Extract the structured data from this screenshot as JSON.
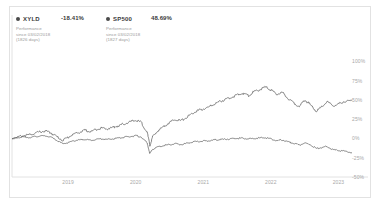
{
  "legend": {
    "entries": [
      {
        "ticker": "XYLD",
        "value": "-18.41%",
        "metric": "Performance",
        "since": "since 03/02/2018",
        "days": "(1826 days)",
        "dot_color": "#4a4a4a"
      },
      {
        "ticker": "SP500",
        "value": "48.69%",
        "metric": "Performance",
        "since": "since 03/02/2018",
        "days": "(1827 days)",
        "dot_color": "#4a4a4a"
      }
    ]
  },
  "chart_data": {
    "type": "line",
    "title": "",
    "xlabel": "",
    "ylabel": "",
    "grid": false,
    "legend_position": "top-left",
    "yticks": [
      "100%",
      "75%",
      "50%",
      "25%",
      "0%",
      "-25%",
      "-50%"
    ],
    "ytick_values": [
      100,
      75,
      50,
      25,
      0,
      -25,
      -50
    ],
    "ylim": [
      -50,
      112
    ],
    "xticks": [
      "2019",
      "2020",
      "2021",
      "2022",
      "2023"
    ],
    "xtick_values": [
      2019,
      2020,
      2021,
      2022,
      2023
    ],
    "xlim": [
      2018.17,
      2023.2
    ],
    "line_color": "#555555",
    "series": [
      {
        "name": "SP500",
        "color": "#555555",
        "x": [
          2018.17,
          2018.25,
          2018.33,
          2018.42,
          2018.5,
          2018.58,
          2018.67,
          2018.75,
          2018.83,
          2018.92,
          2019.0,
          2019.08,
          2019.17,
          2019.25,
          2019.33,
          2019.42,
          2019.5,
          2019.58,
          2019.67,
          2019.75,
          2019.83,
          2019.92,
          2020.0,
          2020.08,
          2020.17,
          2020.21,
          2020.25,
          2020.33,
          2020.42,
          2020.5,
          2020.58,
          2020.67,
          2020.75,
          2020.83,
          2020.92,
          2021.0,
          2021.08,
          2021.17,
          2021.25,
          2021.33,
          2021.42,
          2021.5,
          2021.58,
          2021.67,
          2021.75,
          2021.83,
          2021.92,
          2022.0,
          2022.08,
          2022.17,
          2022.25,
          2022.33,
          2022.42,
          2022.5,
          2022.58,
          2022.67,
          2022.75,
          2022.83,
          2022.92,
          2023.0,
          2023.08,
          2023.2
        ],
        "y": [
          0,
          1.5,
          3.5,
          4.5,
          6.5,
          8.5,
          9.5,
          7.0,
          2.5,
          -2.5,
          1.5,
          5.5,
          8.0,
          10.5,
          8.5,
          12.0,
          13.5,
          12.5,
          14.5,
          16.5,
          19.0,
          21.5,
          23.5,
          21.0,
          8.0,
          -9.5,
          2.0,
          10.0,
          16.0,
          20.5,
          25.0,
          23.0,
          27.0,
          32.0,
          36.0,
          38.0,
          40.5,
          45.0,
          48.0,
          50.5,
          53.5,
          56.0,
          58.5,
          55.5,
          60.5,
          63.0,
          66.5,
          63.0,
          57.0,
          59.5,
          52.0,
          47.0,
          41.0,
          50.0,
          44.0,
          35.5,
          40.5,
          47.5,
          42.0,
          44.5,
          48.0,
          48.69
        ]
      },
      {
        "name": "XYLD",
        "color": "#555555",
        "x": [
          2018.17,
          2018.25,
          2018.33,
          2018.42,
          2018.5,
          2018.58,
          2018.67,
          2018.75,
          2018.83,
          2018.92,
          2019.0,
          2019.08,
          2019.17,
          2019.25,
          2019.33,
          2019.42,
          2019.5,
          2019.58,
          2019.67,
          2019.75,
          2019.83,
          2019.92,
          2020.0,
          2020.08,
          2020.17,
          2020.21,
          2020.25,
          2020.33,
          2020.42,
          2020.5,
          2020.58,
          2020.67,
          2020.75,
          2020.83,
          2020.92,
          2021.0,
          2021.08,
          2021.17,
          2021.25,
          2021.33,
          2021.42,
          2021.5,
          2021.58,
          2021.67,
          2021.75,
          2021.83,
          2021.92,
          2022.0,
          2022.08,
          2022.17,
          2022.25,
          2022.33,
          2022.42,
          2022.5,
          2022.58,
          2022.67,
          2022.75,
          2022.83,
          2022.92,
          2023.0,
          2023.08,
          2023.2
        ],
        "y": [
          0,
          0.8,
          1.8,
          1.2,
          2.2,
          3.0,
          3.2,
          1.5,
          -2.5,
          -7.0,
          -5.5,
          -3.0,
          -2.0,
          -1.0,
          -2.5,
          -1.0,
          -0.5,
          -1.5,
          -0.5,
          0.5,
          1.5,
          2.5,
          3.5,
          2.0,
          -6.0,
          -20.0,
          -14.0,
          -11.0,
          -9.0,
          -8.0,
          -7.0,
          -8.0,
          -6.5,
          -5.0,
          -4.0,
          -3.5,
          -3.0,
          -2.0,
          -1.5,
          -1.0,
          -0.5,
          0.0,
          0.5,
          -0.5,
          0.0,
          0.5,
          1.0,
          -0.5,
          -3.0,
          -2.0,
          -4.5,
          -6.0,
          -8.5,
          -6.0,
          -8.0,
          -13.0,
          -12.0,
          -10.5,
          -14.5,
          -15.5,
          -16.5,
          -18.41
        ]
      }
    ]
  }
}
